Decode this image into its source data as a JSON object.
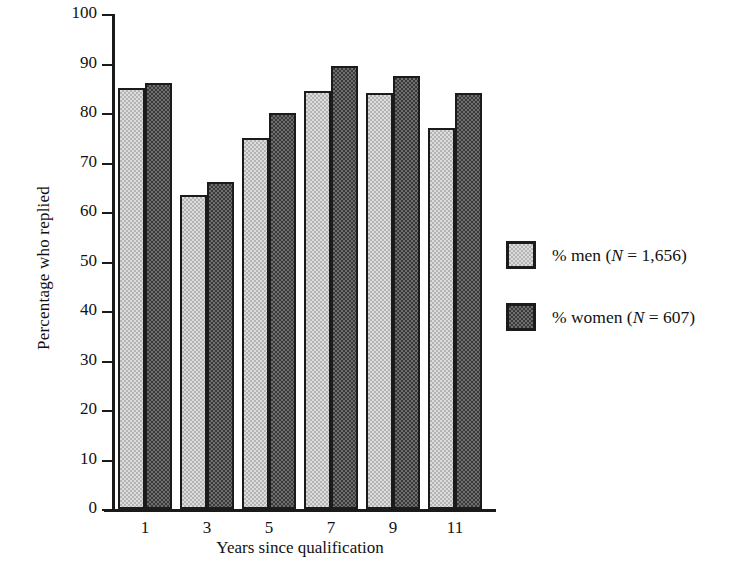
{
  "chart_data": {
    "type": "bar",
    "title": "",
    "xlabel": "Years since qualification",
    "ylabel": "Percentage who replied",
    "categories": [
      "1",
      "3",
      "5",
      "7",
      "9",
      "11"
    ],
    "series": [
      {
        "name": "% men (N = 1,656)",
        "key": "men",
        "values": [
          85,
          63.5,
          75,
          84.5,
          84,
          77
        ]
      },
      {
        "name": "% women (N = 607)",
        "key": "women",
        "values": [
          86,
          66,
          80,
          89.5,
          87.5,
          84
        ]
      }
    ],
    "ylim": [
      0,
      100
    ],
    "yticks": [
      "0",
      "10",
      "20",
      "30",
      "40",
      "50",
      "60",
      "70",
      "80",
      "90",
      "100"
    ],
    "grid": false,
    "legend_position": "right"
  },
  "axes": {
    "y_title": "Percentage who replied",
    "x_title": "Years since qualification"
  },
  "legend": {
    "entries": [
      {
        "swatch": "light-checker-swatch",
        "prefix": "% men (",
        "symbol": "N",
        "suffix": " = 1,656)"
      },
      {
        "swatch": "dark-checker-swatch",
        "prefix": "% women (",
        "symbol": "N",
        "suffix": " = 607)"
      }
    ]
  },
  "colors": {
    "men_fill": "#dcdcdc",
    "women_fill": "#3a3a3a",
    "axis": "#1a1a1a",
    "background": "#ffffff",
    "text": "#111111"
  }
}
